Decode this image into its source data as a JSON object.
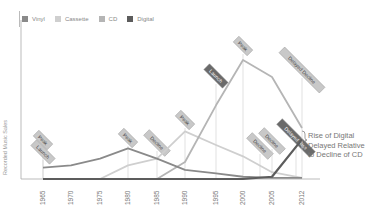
{
  "chart_data": {
    "type": "line",
    "title": "",
    "xlabel": "",
    "ylabel": "Recorded Music Sales",
    "categories": [
      "1965",
      "1970",
      "1975",
      "1980",
      "1985",
      "1990",
      "1995",
      "2000",
      "2005",
      "2012"
    ],
    "x": [
      1965,
      1970,
      1975,
      1980,
      1985,
      1990,
      1995,
      2000,
      2005,
      2012
    ],
    "ylim": [
      0,
      100
    ],
    "grid": false,
    "legend_position": "top-left",
    "series": [
      {
        "name": "Vinyl",
        "color": "#8a8a8a",
        "values": [
          10,
          12,
          18,
          27,
          18,
          8,
          5,
          2,
          1,
          1
        ]
      },
      {
        "name": "Cassette",
        "color": "#cfcfcf",
        "values": [
          0,
          0,
          0,
          12,
          18,
          42,
          30,
          20,
          6,
          1
        ]
      },
      {
        "name": "CD",
        "color": "#b5b5b5",
        "values": [
          0,
          0,
          0,
          0,
          0,
          15,
          65,
          105,
          90,
          45
        ]
      },
      {
        "name": "Digital",
        "color": "#5c5c5c",
        "values": [
          0,
          0,
          0,
          0,
          0,
          0,
          0,
          0,
          2,
          35
        ]
      }
    ],
    "annotations": [
      {
        "x": 1965,
        "label": "Peak",
        "series": "Vinyl"
      },
      {
        "x": 1965,
        "label": "Launch",
        "series": "Vinyl"
      },
      {
        "x": 1980,
        "label": "Peak",
        "series": "Vinyl"
      },
      {
        "x": 1985,
        "label": "Decline",
        "series": "Vinyl"
      },
      {
        "x": 1990,
        "label": "Peak",
        "series": "Cassette"
      },
      {
        "x": 1995,
        "label": "Launch",
        "series": "CD"
      },
      {
        "x": 2000,
        "label": "Peak",
        "series": "CD"
      },
      {
        "x": 2003,
        "label": "Decline",
        "series": "Cassette"
      },
      {
        "x": 2005,
        "label": "Decline",
        "series": "CD"
      },
      {
        "x": 2010,
        "label": "Delayed Rise",
        "series": "Digital"
      },
      {
        "x": 2012,
        "label": "Delayed Decline",
        "series": "CD"
      }
    ],
    "side_note": "Rise of Digital Delayed Relative to Decline of CD"
  },
  "legend": [
    {
      "label": "Vinyl",
      "color": "#8a8a8a"
    },
    {
      "label": "Cassette",
      "color": "#cfcfcf"
    },
    {
      "label": "CD",
      "color": "#b5b5b5"
    },
    {
      "label": "Digital",
      "color": "#5c5c5c"
    }
  ],
  "annotation_text": {
    "line1": "Rise of Digital",
    "line2": "Delayed Relative",
    "line3": "to Decline of CD"
  },
  "y_axis_label": "Recorded Music Sales"
}
